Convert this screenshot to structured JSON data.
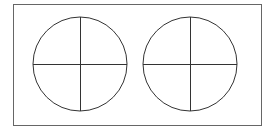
{
  "diagram": {
    "type": "line-drawing",
    "colors": {
      "background": "#ffffff",
      "stroke": "#333333",
      "frame": "#666666"
    },
    "frame": {
      "x": 13.5,
      "y": 4.5,
      "width": 248,
      "height": 121
    },
    "circles": [
      {
        "label": "circle-left",
        "cx": 80,
        "cy": 64,
        "r": 47,
        "quadrants": 4
      },
      {
        "label": "circle-right",
        "cx": 190,
        "cy": 64,
        "r": 47,
        "quadrants": 4
      }
    ]
  }
}
